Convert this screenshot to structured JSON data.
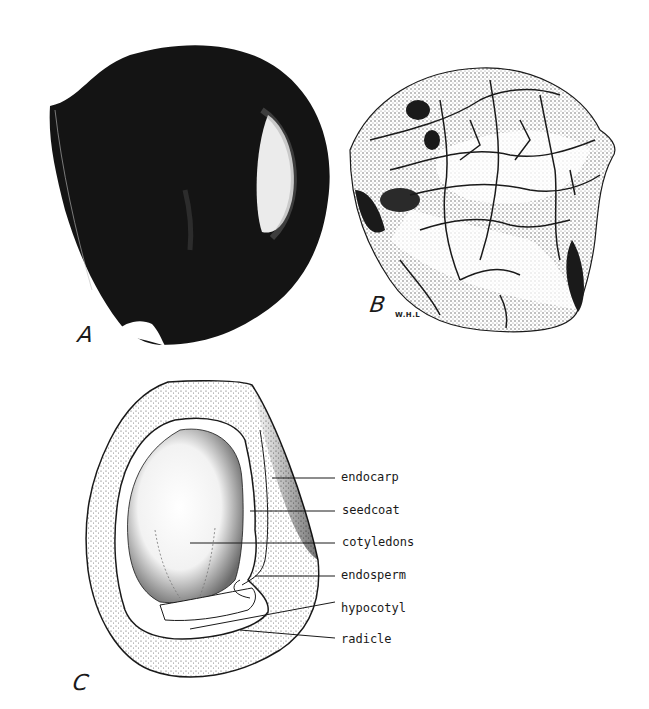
{
  "figure": {
    "panels": [
      {
        "id": "A",
        "letter": "A",
        "description": "Intact fruit, dark glossy exterior"
      },
      {
        "id": "B",
        "letter": "B",
        "description": "Stone (endocarp) with reticulate surface",
        "initials": "W.H.L"
      },
      {
        "id": "C",
        "letter": "C",
        "description": "Longitudinal section"
      }
    ],
    "labels": [
      {
        "text": "endocarp"
      },
      {
        "text": "seedcoat"
      },
      {
        "text": "cotyledons"
      },
      {
        "text": "endosperm"
      },
      {
        "text": "hypocotyl"
      },
      {
        "text": "radicle"
      }
    ],
    "colors": {
      "ink": "#141414",
      "paper": "#ffffff",
      "stipple": "#6b6b6b"
    }
  }
}
